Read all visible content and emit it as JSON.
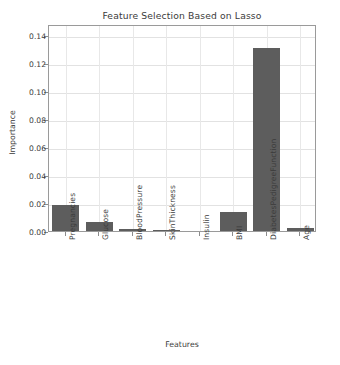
{
  "chart_data": {
    "type": "bar",
    "title": "Feature Selection Based on Lasso",
    "xlabel": "Features",
    "ylabel": "Importance",
    "categories": [
      "Pregnancies",
      "Glucose",
      "BloodPressure",
      "SkinThickness",
      "Insulin",
      "BMI",
      "DiabetesPedigreeFunction",
      "Age"
    ],
    "values": [
      0.0185,
      0.0061,
      0.0015,
      0.0008,
      0.0,
      0.0135,
      0.1305,
      0.0021
    ],
    "ylim": [
      0.0,
      0.1475
    ],
    "xlim": [
      -0.5,
      7.5
    ],
    "yticks": [
      0.0,
      0.02,
      0.04,
      0.06,
      0.08,
      0.1,
      0.12,
      0.14
    ],
    "ytick_labels": [
      "0.00",
      "0.02",
      "0.04",
      "0.06",
      "0.08",
      "0.10",
      "0.12",
      "0.14"
    ],
    "grid": true,
    "grid_axis": "both",
    "legend": false,
    "legend_position": "none",
    "bar_color": "#5d5d5d",
    "grid_color": "#e2e2e2",
    "axis_color": "#9a9a9a",
    "background_color": "#ffffff",
    "text_color": "#3b3b3b",
    "xtick_rotation": -90,
    "bar_width_fraction": 0.8
  }
}
